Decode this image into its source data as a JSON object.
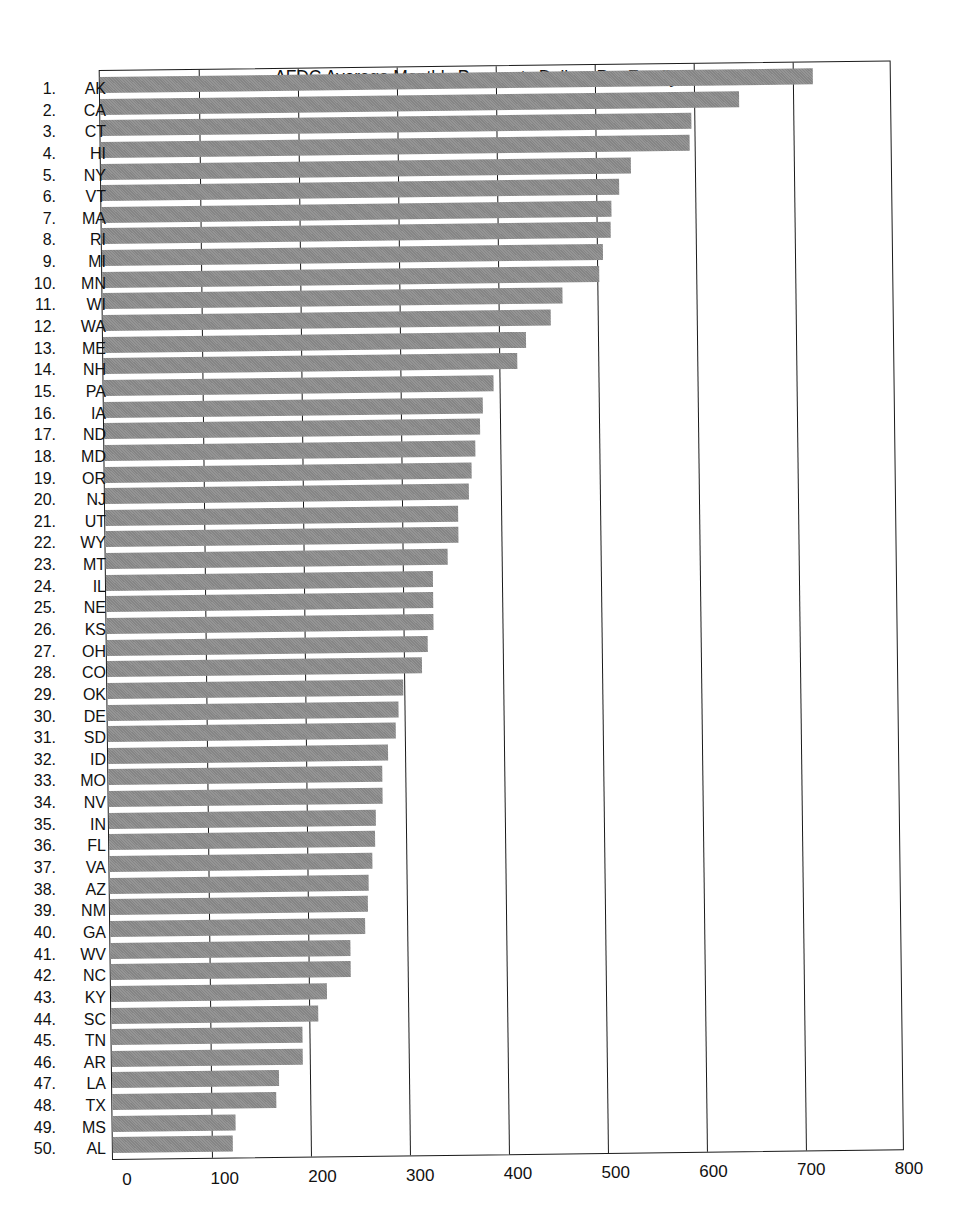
{
  "chart_data": {
    "type": "bar",
    "orientation": "horizontal",
    "title": "AFDC Average Monthly Payments Dollars Per Family: 1990",
    "xlabel": "",
    "ylabel": "",
    "xlim": [
      0,
      800
    ],
    "x_ticks": [
      0,
      100,
      200,
      300,
      400,
      500,
      600,
      700,
      800
    ],
    "grid": "vertical lines at each 100",
    "legend": "none",
    "bar_color": "#8c8c8c",
    "ranks": [
      "1.",
      "2.",
      "3.",
      "4.",
      "5.",
      "6.",
      "7.",
      "8.",
      "9.",
      "10.",
      "11.",
      "12.",
      "13.",
      "14.",
      "15.",
      "16.",
      "17.",
      "18.",
      "19.",
      "20.",
      "21.",
      "22.",
      "23.",
      "24.",
      "25.",
      "26.",
      "27.",
      "28.",
      "29.",
      "30.",
      "31.",
      "32.",
      "33.",
      "34.",
      "35.",
      "36.",
      "37.",
      "38.",
      "39.",
      "40.",
      "41.",
      "42.",
      "43.",
      "44.",
      "45.",
      "46.",
      "47.",
      "48.",
      "49.",
      "50."
    ],
    "categories": [
      "AK",
      "CA",
      "CT",
      "HI",
      "NY",
      "VT",
      "MA",
      "RI",
      "MI",
      "MN",
      "WI",
      "WA",
      "ME",
      "NH",
      "PA",
      "IA",
      "ND",
      "MD",
      "OR",
      "NJ",
      "UT",
      "WY",
      "MT",
      "IL",
      "NE",
      "KS",
      "OH",
      "CO",
      "OK",
      "DE",
      "SD",
      "ID",
      "MO",
      "NV",
      "IN",
      "FL",
      "VA",
      "AZ",
      "NM",
      "GA",
      "WV",
      "NC",
      "KY",
      "SC",
      "TN",
      "AR",
      "LA",
      "TX",
      "MS",
      "AL"
    ],
    "values": [
      720,
      645,
      597,
      595,
      535,
      523,
      515,
      514,
      506,
      502,
      465,
      453,
      427,
      418,
      394,
      383,
      380,
      375,
      371,
      368,
      357,
      357,
      345,
      330,
      330,
      330,
      324,
      318,
      299,
      294,
      291,
      283,
      277,
      277,
      270,
      269,
      266,
      262,
      261,
      258,
      242,
      242,
      218,
      209,
      193,
      193,
      169,
      166,
      124,
      121
    ]
  }
}
